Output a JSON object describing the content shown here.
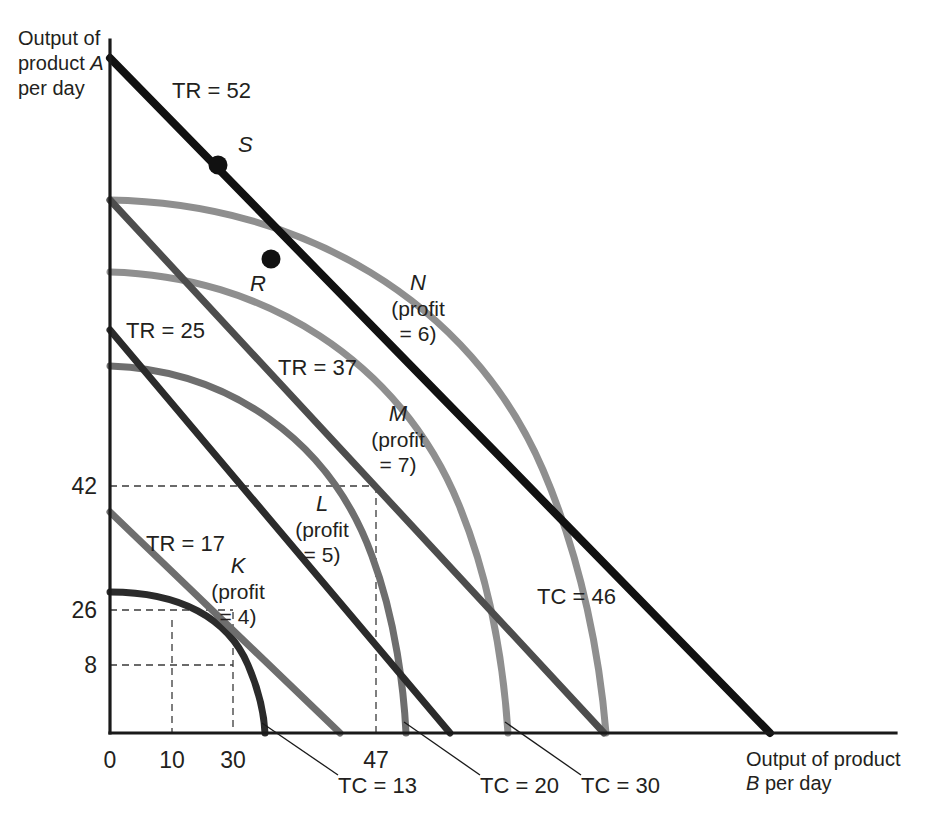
{
  "figure": {
    "kind": "isorevenue-isocost-product-transformation",
    "background": "#ffffff"
  },
  "axes": {
    "y_title_line1": "Output of",
    "y_title_line2": "product A",
    "y_title_line3": "per day",
    "x_title_line1": "Output of product",
    "x_title_line2": "B per day",
    "y_ticks": [
      "42",
      "26",
      "8"
    ],
    "x_ticks": [
      "0",
      "10",
      "30",
      "47"
    ]
  },
  "series_labels": {
    "tr52": "TR = 52",
    "tr37": "TR = 37",
    "tr25": "TR = 25",
    "tr17": "TR = 17",
    "tc46": "TC = 46",
    "tc30": "TC = 30",
    "tc20": "TC = 20",
    "tc13": "TC = 13"
  },
  "points": [
    {
      "name": "S",
      "label": "S",
      "sub1": "",
      "sub2": ""
    },
    {
      "name": "R",
      "label": "R",
      "sub1": "",
      "sub2": ""
    },
    {
      "name": "N",
      "label": "N",
      "sub1": "(profit",
      "sub2": "= 6)"
    },
    {
      "name": "M",
      "label": "M",
      "sub1": "(profit",
      "sub2": "= 7)"
    },
    {
      "name": "L",
      "label": "L",
      "sub1": "(profit",
      "sub2": "= 5)"
    },
    {
      "name": "K",
      "label": "K",
      "sub1": "(profit",
      "sub2": "= 4)"
    }
  ],
  "colors": {
    "axis": "#1a1a1a",
    "black": "#111111",
    "dark_gray": "#4d4d4d",
    "mid_gray": "#6e6e6e",
    "light_gray": "#8f8f8f",
    "grid": "#3a3a3a",
    "text": "#231f20"
  },
  "chart_data": {
    "type": "line",
    "title": "",
    "xlabel": "Output of product B per day",
    "ylabel": "Output of product A per day",
    "xlim": [
      0,
      130
    ],
    "ylim": [
      0,
      130
    ],
    "grid": false,
    "legend": "inline-annotations",
    "x_tick_values": [
      0,
      10,
      30,
      47
    ],
    "y_tick_values": [
      42,
      26,
      8
    ],
    "series": [
      {
        "name": "TR = 52",
        "type": "isorevenue-line",
        "value": 52,
        "color": "#111111",
        "x_intercept": 108,
        "y_intercept": 117
      },
      {
        "name": "TR = 37",
        "type": "isorevenue-line",
        "value": 37,
        "color": "#4d4d4d",
        "x_intercept": 79,
        "y_intercept": 86
      },
      {
        "name": "TR = 25",
        "type": "isorevenue-line",
        "value": 25,
        "color": "#2b2b2b",
        "x_intercept": 53,
        "y_intercept": 58
      },
      {
        "name": "TR = 17",
        "type": "isorevenue-line",
        "value": 17,
        "color": "#6e6e6e",
        "x_intercept": 33,
        "y_intercept": 36
      },
      {
        "name": "TC = 46",
        "type": "isocost-curve",
        "value": 46,
        "color": "#8f8f8f",
        "a_intercept": 100,
        "b_intercept": 100
      },
      {
        "name": "TC = 30",
        "type": "isocost-curve",
        "value": 30,
        "color": "#8f8f8f",
        "a_intercept": 79,
        "b_intercept": 79
      },
      {
        "name": "TC = 20",
        "type": "isocost-curve",
        "value": 20,
        "color": "#6e6e6e",
        "a_intercept": 61,
        "b_intercept": 61
      },
      {
        "name": "TC = 13",
        "type": "isocost-curve",
        "value": 13,
        "color": "#2b2b2b",
        "a_intercept": 43,
        "b_intercept": 43
      }
    ],
    "annotated_points": [
      {
        "label": "S",
        "note": "on TR = 52",
        "profit": null
      },
      {
        "label": "R",
        "note": "on TC = 46 and TR = 52",
        "profit": null
      },
      {
        "label": "N",
        "profit": 6,
        "note": "tangency of TC = 46 with TR = 52"
      },
      {
        "label": "M",
        "profit": 7,
        "note": "tangency of TC = 30 with TR = 37"
      },
      {
        "label": "L",
        "profit": 5,
        "note": "tangency of TC = 20 with TR = 25",
        "x": 47,
        "y": 42
      },
      {
        "label": "K",
        "profit": 4,
        "note": "tangency of TC = 13 with TR = 17",
        "x": 30,
        "y": 26
      }
    ],
    "reference_lines": [
      {
        "orientation": "horizontal",
        "value": 42
      },
      {
        "orientation": "horizontal",
        "value": 26
      },
      {
        "orientation": "horizontal",
        "value": 8
      },
      {
        "orientation": "vertical",
        "value": 10
      },
      {
        "orientation": "vertical",
        "value": 30
      },
      {
        "orientation": "vertical",
        "value": 47
      }
    ]
  }
}
